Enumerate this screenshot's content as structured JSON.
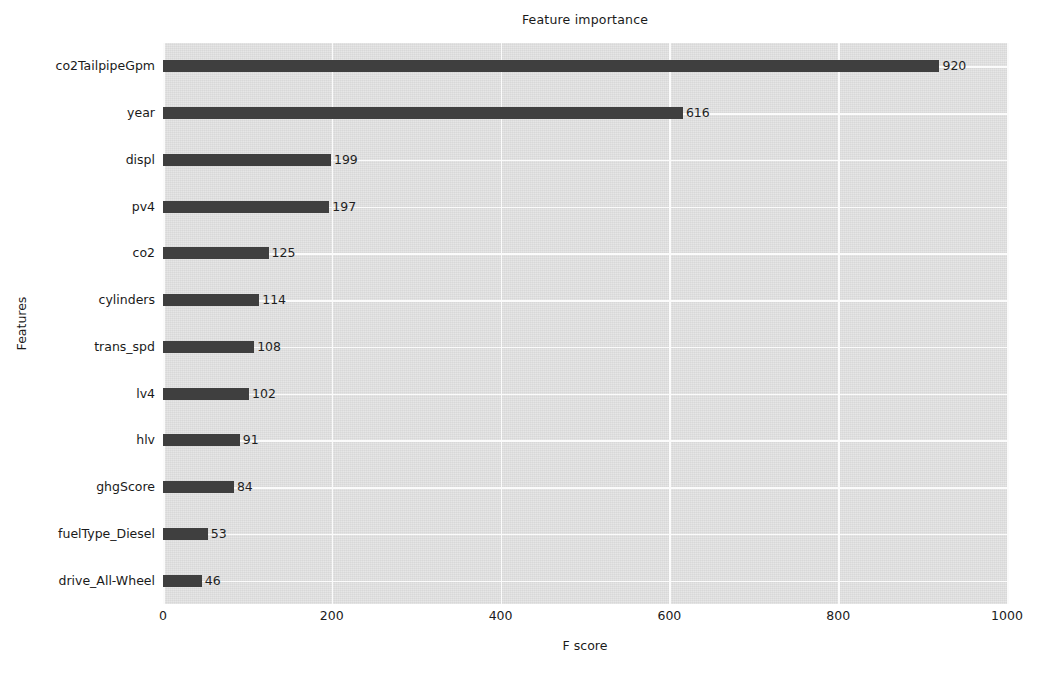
{
  "chart_data": {
    "type": "bar",
    "orientation": "horizontal",
    "title": "Feature importance",
    "xlabel": "F score",
    "ylabel": "Features",
    "xlim": [
      0,
      1000
    ],
    "xticks": [
      "0",
      "200",
      "400",
      "600",
      "800",
      "1000"
    ],
    "xtick_values": [
      0,
      200,
      400,
      600,
      800,
      1000
    ],
    "grid": true,
    "legend": "none",
    "categories": [
      "co2TailpipeGpm",
      "year",
      "displ",
      "pv4",
      "co2",
      "cylinders",
      "trans_spd",
      "lv4",
      "hlv",
      "ghgScore",
      "fuelType_Diesel",
      "drive_All-Wheel"
    ],
    "values": [
      920,
      616,
      199,
      197,
      125,
      114,
      108,
      102,
      91,
      84,
      53,
      46
    ],
    "value_labels": [
      "920",
      "616",
      "199",
      "197",
      "125",
      "114",
      "108",
      "102",
      "91",
      "84",
      "53",
      "46"
    ],
    "bar_color": "#3f3f3f",
    "plot_background": "#e4e4e4",
    "grid_color": "#fbfbfb",
    "figure_background": "#ffffff"
  }
}
